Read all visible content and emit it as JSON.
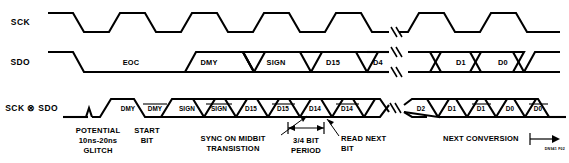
{
  "figure": {
    "id_code": "DN941 F02",
    "signals": [
      {
        "name": "SCK"
      },
      {
        "name": "SDO"
      },
      {
        "name": "SCK ⊗ SDO"
      }
    ],
    "sdo_bits": [
      "EOC",
      "DMY",
      "SIGN",
      "D15",
      "D4",
      "D1",
      "D0"
    ],
    "xor_bits": [
      {
        "label": "DMY",
        "inverted": false
      },
      {
        "label": "DMY",
        "inverted": true
      },
      {
        "label": "SIGN",
        "inverted": false
      },
      {
        "label": "SIGN",
        "inverted": true
      },
      {
        "label": "D15",
        "inverted": false
      },
      {
        "label": "D15",
        "inverted": true
      },
      {
        "label": "D14",
        "inverted": false
      },
      {
        "label": "D14",
        "inverted": true
      },
      {
        "label": "D2",
        "inverted": false
      },
      {
        "label": "D1",
        "inverted": false
      },
      {
        "label": "D1",
        "inverted": true
      },
      {
        "label": "D0",
        "inverted": false
      },
      {
        "label": "D0",
        "inverted": true
      }
    ],
    "annotations": {
      "glitch": [
        "POTENTIAL",
        "10ns-20ns",
        "GLITCH"
      ],
      "start_bit": [
        "START",
        "BIT"
      ],
      "sync_midbit": [
        "SYNC ON MIDBIT",
        "TRANSISTION"
      ],
      "bit_period": [
        "3/4 BIT",
        "PERIOD"
      ],
      "read_next_bit": [
        "READ NEXT",
        "BIT"
      ],
      "next_conversion": "NEXT CONVERSION"
    }
  }
}
